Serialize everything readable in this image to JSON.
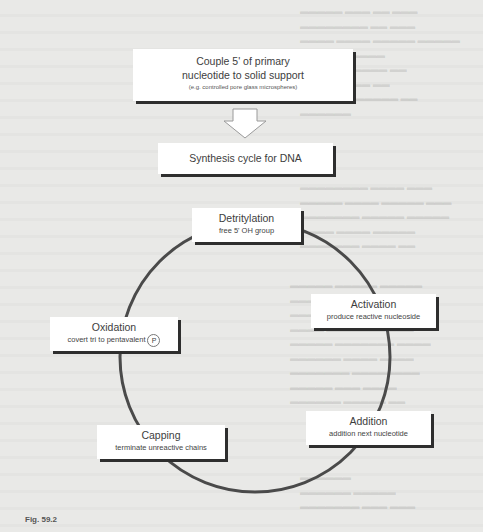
{
  "figure": {
    "caption": "Fig. 59.2"
  },
  "diagram": {
    "type": "flow-cycle",
    "start_box": {
      "line1": "Couple 5' of primary",
      "line2": "nucleotide to solid support",
      "line3": "(e.g. controlled pore glass microspheres)"
    },
    "arrow": "down-arrow",
    "cycle_title": "Synthesis cycle for DNA",
    "cycle_steps": [
      {
        "title": "Detritylation",
        "subtitle": "free 5' OH group"
      },
      {
        "title": "Activation",
        "subtitle": "produce reactive nucleoside"
      },
      {
        "title": "Addition",
        "subtitle": "addition next nucleotide"
      },
      {
        "title": "Capping",
        "subtitle": "terminate unreactive chains"
      },
      {
        "title": "Oxidation",
        "subtitle": "covert tri to pentavalent",
        "badge": "P"
      }
    ]
  },
  "colors": {
    "background": "#e9e9e7",
    "box_fill": "#ffffff",
    "box_shadow": "#2e2e2e",
    "cycle_line": "#4a4a4a",
    "text": "#3d3d3d"
  }
}
